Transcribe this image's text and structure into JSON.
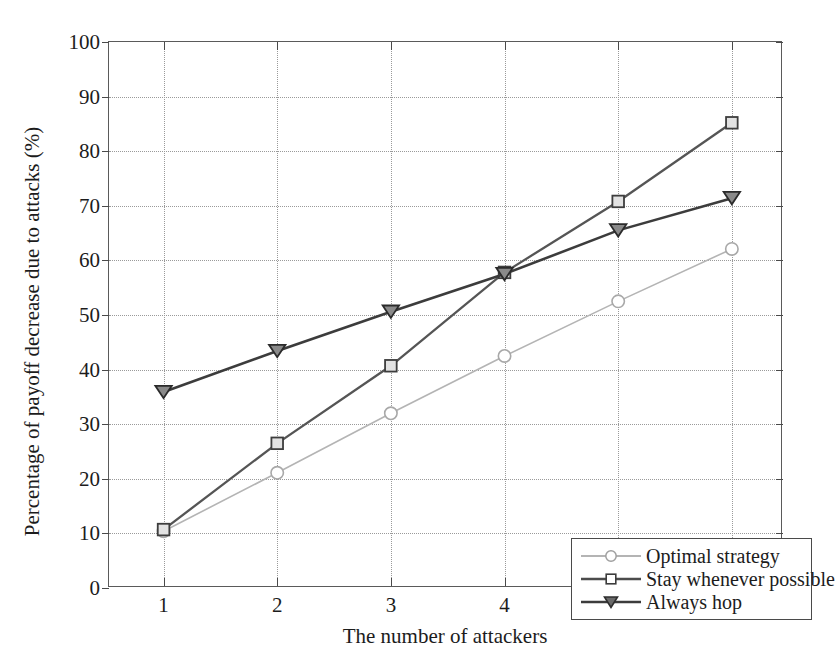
{
  "chart_data": {
    "type": "line",
    "title": "",
    "xlabel": "The number of attackers",
    "ylabel": "Percentage of payoff decrease due to attacks (%)",
    "x": [
      1,
      2,
      3,
      4,
      5,
      6
    ],
    "xticklabels": [
      "1",
      "2",
      "3",
      "4",
      "5",
      "6"
    ],
    "yticklabels": [
      "0",
      "10",
      "20",
      "30",
      "40",
      "50",
      "60",
      "70",
      "80",
      "90",
      "100"
    ],
    "yticks": [
      0,
      10,
      20,
      30,
      40,
      50,
      60,
      70,
      80,
      90,
      100
    ],
    "xlim": [
      0.52,
      6.45
    ],
    "ylim": [
      0,
      100
    ],
    "grid": true,
    "grid_style": "dotted",
    "legend_position": "lower right",
    "series": [
      {
        "name": "Optimal strategy",
        "marker": "circle",
        "color": "#b4b4b4",
        "values": [
          10.4,
          21.1,
          32.0,
          42.5,
          52.5,
          62.1
        ]
      },
      {
        "name": "Stay whenever possible",
        "marker": "square",
        "color": "#555555",
        "values": [
          10.7,
          26.5,
          40.7,
          57.8,
          70.8,
          85.2
        ]
      },
      {
        "name": "Always hop",
        "marker": "triangle-down",
        "color": "#3c3c3c",
        "values": [
          35.9,
          43.4,
          50.6,
          57.5,
          65.5,
          71.4
        ]
      }
    ]
  },
  "axes": {
    "x_title": "The number of attackers",
    "y_title": "Percentage of payoff decrease due to attacks (%)"
  },
  "legend": {
    "entries": [
      {
        "label": "Optimal strategy"
      },
      {
        "label": "Stay whenever possible"
      },
      {
        "label": "Always hop"
      }
    ]
  },
  "colors": {
    "optimal": "#b4b4b4",
    "stay": "#555555",
    "hop": "#3c3c3c",
    "axis": "#5a5a5a",
    "grid": "#9a9a9a"
  }
}
